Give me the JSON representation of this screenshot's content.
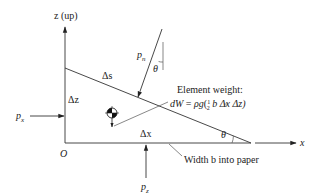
{
  "diagram": {
    "type": "free-body diagram of fluid wedge element",
    "axes": {
      "z_label": "z (up)",
      "x_label": "x",
      "origin_label": "O"
    },
    "element": {
      "hypotenuse_label": "Δs",
      "vertical_side_label": "Δz",
      "horizontal_side_label": "Δx",
      "angle_label": "θ"
    },
    "forces": {
      "normal_pressure_label": "p",
      "normal_pressure_sub": "n",
      "normal_angle_label": "θ",
      "horizontal_pressure_label": "p",
      "horizontal_pressure_sub": "x",
      "vertical_pressure_label": "p",
      "vertical_pressure_sub": "z"
    },
    "weight": {
      "title": "Element weight:",
      "eq_lhs": "dW",
      "eq_eq": " = ",
      "eq_rho_g": "ρg",
      "eq_open": "(",
      "eq_frac_num": "1",
      "eq_frac_den": "2",
      "eq_rest": " b Δx Δz)"
    },
    "width_note": "Width b into paper"
  }
}
